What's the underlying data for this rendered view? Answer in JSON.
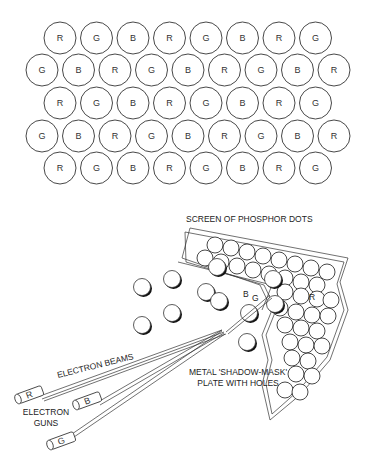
{
  "diagram": {
    "grid": {
      "rows": [
        {
          "offset": "short",
          "letters": [
            "R",
            "G",
            "B",
            "R",
            "G",
            "B",
            "R",
            "G"
          ]
        },
        {
          "offset": "long",
          "letters": [
            "G",
            "B",
            "R",
            "G",
            "B",
            "R",
            "G",
            "B",
            "R"
          ]
        },
        {
          "offset": "short",
          "letters": [
            "R",
            "G",
            "B",
            "R",
            "G",
            "B",
            "R",
            "G"
          ]
        },
        {
          "offset": "long",
          "letters": [
            "G",
            "B",
            "R",
            "G",
            "B",
            "R",
            "G",
            "B",
            "R"
          ]
        },
        {
          "offset": "short",
          "letters": [
            "R",
            "G",
            "B",
            "R",
            "G",
            "B",
            "R",
            "G"
          ]
        }
      ]
    },
    "labels": {
      "screen": "SCREEN OF PHOSPHOR DOTS",
      "beams": "ELECTRON BEAMS",
      "mask_line1": "METAL 'SHADOW-MASK'",
      "mask_line2": "PLATE WITH HOLES",
      "guns_line1": "ELECTRON",
      "guns_line2": "GUNS"
    },
    "guns": [
      {
        "letter": "R"
      },
      {
        "letter": "B"
      },
      {
        "letter": "G"
      }
    ],
    "screen_dot_letters": [
      "G",
      "B",
      "R"
    ]
  }
}
